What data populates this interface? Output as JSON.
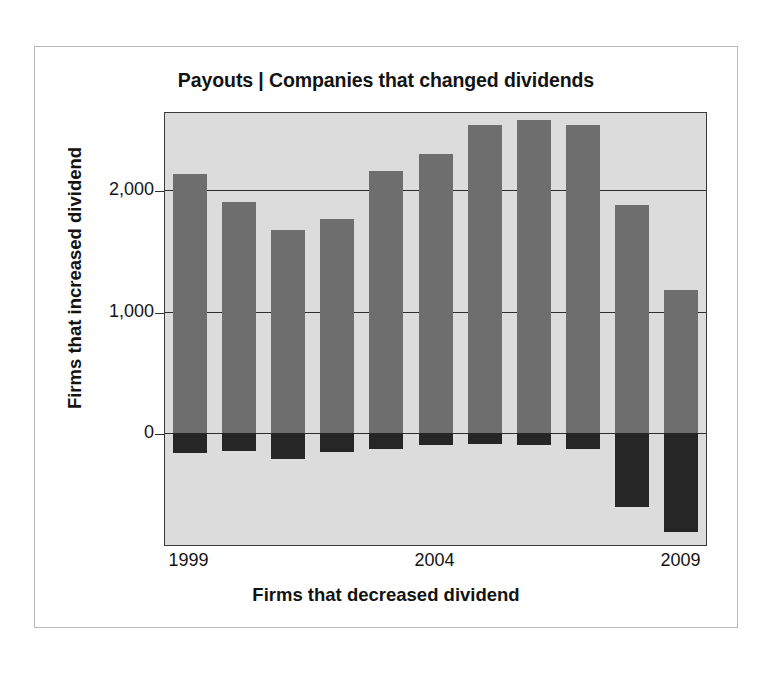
{
  "chart_data": {
    "type": "bar",
    "title": "Payouts | Companies that changed dividends",
    "xlabel": "Firms that decreased dividend",
    "ylabel": "Firms that increased dividend",
    "categories": [
      "1999",
      "2000",
      "2001",
      "2002",
      "2003",
      "2004",
      "2005",
      "2006",
      "2007",
      "2008",
      "2009"
    ],
    "x_tick_labels": [
      "1999",
      "2004",
      "2009"
    ],
    "x_tick_categories": [
      "1999",
      "2004",
      "2009"
    ],
    "y_tick_labels": [
      "2,000",
      "1,000",
      "0"
    ],
    "y_tick_values": [
      2000,
      1000,
      0
    ],
    "ylim": [
      -920,
      2636
    ],
    "grid": true,
    "legend": "none",
    "series": [
      {
        "name": "Firms that increased dividend",
        "color": "#6e6e6e",
        "values": [
          2136,
          1907,
          1670,
          1763,
          2160,
          2300,
          2540,
          2580,
          2540,
          1878,
          1176
        ]
      },
      {
        "name": "Firms that decreased dividend",
        "color": "#262626",
        "values": [
          -160,
          -143,
          -210,
          -151,
          -126,
          -100,
          -85,
          -100,
          -126,
          -605,
          -815
        ]
      }
    ]
  },
  "style": {
    "plot_background": "#dcdcdc",
    "axis_color": "#2e2e2e",
    "frame_color": "#b9b9b9",
    "page_background": "#ffffff",
    "positive_bar_color": "#6e6e6e",
    "negative_bar_color": "#262626"
  }
}
